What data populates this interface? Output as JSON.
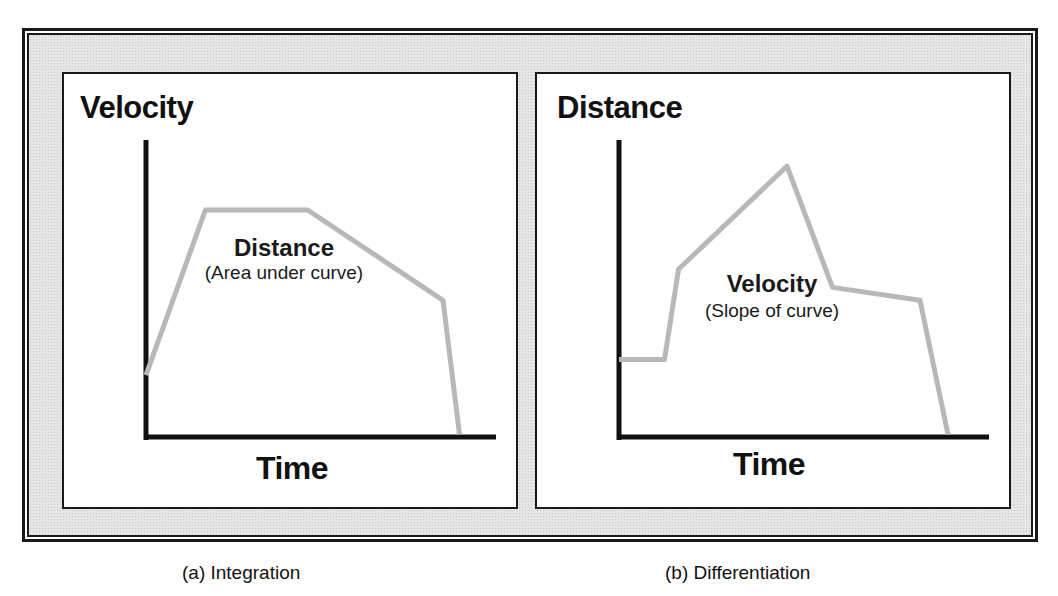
{
  "colors": {
    "axis": "#111111",
    "curve": "#b8b8b8",
    "frame_fill": "#e6e6e6",
    "panel_bg": "#ffffff"
  },
  "panels": [
    {
      "id": "integration",
      "y_axis_label": "Velocity",
      "x_axis_label": "Time",
      "inner_title": "Distance",
      "inner_subtitle": "(Area under curve)",
      "caption": "(a) Integration"
    },
    {
      "id": "differentiation",
      "y_axis_label": "Distance",
      "x_axis_label": "Time",
      "inner_title": "Velocity",
      "inner_subtitle": "(Slope of curve)",
      "caption": "(b) Differentiation"
    }
  ],
  "chart_data": [
    {
      "type": "line",
      "title": "Integration",
      "xlabel": "Time",
      "ylabel": "Velocity",
      "x_ticks": [],
      "y_ticks": [],
      "grid": false,
      "xlim": [
        0,
        100
      ],
      "ylim": [
        0,
        100
      ],
      "series": [
        {
          "name": "velocity",
          "x": [
            0,
            18,
            49,
            90,
            95
          ],
          "y": [
            24,
            88,
            88,
            53,
            1
          ]
        }
      ],
      "annotations": [
        "Distance",
        "(Area under curve)"
      ]
    },
    {
      "type": "line",
      "title": "Differentiation",
      "xlabel": "Time",
      "ylabel": "Distance",
      "x_ticks": [],
      "y_ticks": [],
      "grid": false,
      "xlim": [
        0,
        100
      ],
      "ylim": [
        0,
        100
      ],
      "series": [
        {
          "name": "distance",
          "x": [
            0,
            13,
            17,
            48,
            61,
            86,
            94
          ],
          "y": [
            30,
            30,
            65,
            105,
            58,
            53,
            1
          ]
        }
      ],
      "annotations": [
        "Velocity",
        "(Slope of curve)"
      ]
    }
  ]
}
